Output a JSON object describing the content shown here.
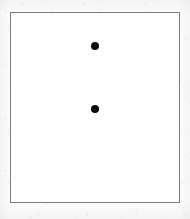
{
  "figure": {
    "background_color": "#ffffff",
    "page_background_color": "#fcfcfc",
    "frame": {
      "border_color": "#7d7d7d",
      "border_width_px": 1,
      "left_px": 10,
      "top_px": 12,
      "width_px": 170,
      "height_px": 191
    },
    "marker_color": "#0a0a0a"
  },
  "chart_data": {
    "type": "scatter",
    "title": "",
    "subtitle": "",
    "xlabel": "",
    "ylabel": "",
    "xlim": [
      0,
      170
    ],
    "ylim": [
      0,
      191
    ],
    "grid": false,
    "legend": null,
    "tick_labels": {
      "x": [],
      "y": []
    },
    "annotations": [],
    "series": [
      {
        "name": "points",
        "marker": "filled-circle",
        "marker_color": "#0a0a0a",
        "marker_diameter_px": 8,
        "points": [
          {
            "label": "upper-point",
            "x": 84,
            "y": 33,
            "cx_px": 84,
            "cy_px": 33
          },
          {
            "label": "lower-point",
            "x": 84,
            "y": 96,
            "cx_px": 84,
            "cy_px": 96
          }
        ]
      }
    ]
  }
}
